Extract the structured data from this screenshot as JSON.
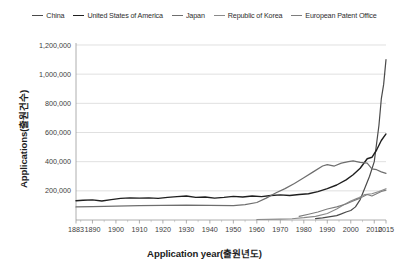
{
  "chart_data": {
    "type": "line",
    "title": "",
    "xlabel": "Application year(출원년도)",
    "ylabel": "Applications(출원건수)",
    "xlim": [
      1883,
      2015
    ],
    "ylim": [
      0,
      1200000
    ],
    "grid": true,
    "legend_position": "top-center",
    "xticks": [
      "1883",
      "1890",
      "1900",
      "1910",
      "1920",
      "1930",
      "1940",
      "1950",
      "1960",
      "1970",
      "1980",
      "1990",
      "2000",
      "2010",
      "2015"
    ],
    "xtick_values": [
      1883,
      1890,
      1900,
      1910,
      1920,
      1930,
      1940,
      1950,
      1960,
      1970,
      1980,
      1990,
      2000,
      2010,
      2015
    ],
    "yticks": [
      "200,000",
      "400,000",
      "600,000",
      "800,000",
      "1,000,000",
      "1,200,000"
    ],
    "ytick_values": [
      200000,
      400000,
      600000,
      800000,
      1000000,
      1200000
    ],
    "series": [
      {
        "name": "China",
        "color": "#4a4a4a",
        "width": 1.2,
        "x": [
          1985,
          1988,
          1990,
          1992,
          1994,
          1996,
          1998,
          2000,
          2002,
          2004,
          2006,
          2008,
          2010,
          2012,
          2013,
          2014,
          2015
        ],
        "values": [
          9000,
          14000,
          20000,
          25000,
          30000,
          42000,
          55000,
          65000,
          90000,
          140000,
          220000,
          300000,
          400000,
          650000,
          830000,
          930000,
          1100000
        ]
      },
      {
        "name": "United States of America",
        "color": "#1f1f1f",
        "width": 1.4,
        "x": [
          1883,
          1886,
          1890,
          1894,
          1898,
          1902,
          1906,
          1910,
          1914,
          1918,
          1922,
          1926,
          1930,
          1934,
          1938,
          1942,
          1946,
          1950,
          1954,
          1958,
          1962,
          1966,
          1970,
          1974,
          1978,
          1982,
          1986,
          1990,
          1994,
          1998,
          2001,
          2004,
          2007,
          2009,
          2011,
          2013,
          2015
        ],
        "values": [
          132000,
          135000,
          138000,
          130000,
          140000,
          148000,
          152000,
          150000,
          152000,
          148000,
          155000,
          160000,
          165000,
          155000,
          158000,
          150000,
          155000,
          162000,
          158000,
          165000,
          160000,
          168000,
          172000,
          168000,
          175000,
          180000,
          195000,
          215000,
          240000,
          275000,
          310000,
          355000,
          420000,
          430000,
          480000,
          545000,
          590000
        ]
      },
      {
        "name": "Japan",
        "color": "#6e6e6e",
        "width": 1.2,
        "x": [
          1883,
          1890,
          1900,
          1910,
          1920,
          1930,
          1940,
          1950,
          1955,
          1960,
          1964,
          1968,
          1972,
          1976,
          1980,
          1984,
          1988,
          1990,
          1993,
          1996,
          1999,
          2001,
          2004,
          2007,
          2009,
          2011,
          2013,
          2015
        ],
        "values": [
          90000,
          92000,
          95000,
          98000,
          100000,
          102000,
          100000,
          98000,
          105000,
          120000,
          150000,
          185000,
          215000,
          250000,
          290000,
          330000,
          370000,
          380000,
          370000,
          390000,
          400000,
          405000,
          395000,
          390000,
          350000,
          345000,
          330000,
          320000
        ]
      },
      {
        "name": "Republic of Korea",
        "color": "#8a8a8a",
        "width": 1.1,
        "x": [
          1960,
          1970,
          1975,
          1980,
          1985,
          1990,
          1994,
          1997,
          2000,
          2003,
          2006,
          2009,
          2012,
          2015
        ],
        "values": [
          3000,
          6000,
          9000,
          16000,
          25000,
          45000,
          75000,
          105000,
          130000,
          150000,
          175000,
          180000,
          195000,
          215000
        ]
      },
      {
        "name": "European Patent Office",
        "color": "#7d7d7d",
        "width": 1.1,
        "x": [
          1978,
          1982,
          1986,
          1990,
          1994,
          1998,
          2001,
          2004,
          2007,
          2009,
          2011,
          2013,
          2015
        ],
        "values": [
          25000,
          40000,
          55000,
          75000,
          90000,
          110000,
          130000,
          150000,
          175000,
          165000,
          180000,
          195000,
          205000
        ]
      }
    ]
  },
  "legend": {
    "entries": [
      {
        "label": "China"
      },
      {
        "label": "United States of America"
      },
      {
        "label": "Japan"
      },
      {
        "label": "Republic of Korea"
      },
      {
        "label": "European Patent Office"
      }
    ]
  },
  "axes": {
    "x_title": "Application year(출원년도)",
    "y_title": "Applications(출원건수)"
  }
}
